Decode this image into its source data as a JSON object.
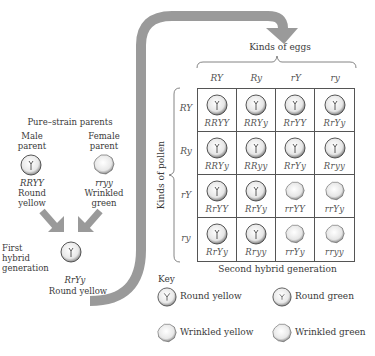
{
  "figure": {
    "parents_title": "Pure–strain parents",
    "male": {
      "label_line1": "Male",
      "label_line2": "parent",
      "genotype": "RRYY",
      "phenotype_line1": "Round",
      "phenotype_line2": "yellow",
      "pea": "round"
    },
    "female": {
      "label_line1": "Female",
      "label_line2": "parent",
      "genotype": "rryy",
      "phenotype_line1": "Wrinkled",
      "phenotype_line2": "green",
      "pea": "wrinkled"
    },
    "f1": {
      "label_line1": "First",
      "label_line2": "hybrid",
      "label_line3": "generation",
      "genotype": "RrYy",
      "phenotype": "Round yellow",
      "pea": "round"
    },
    "eggs_title": "Kinds of eggs",
    "pollen_title": "Kinds of pollen",
    "egg_types": [
      "RY",
      "Ry",
      "rY",
      "ry"
    ],
    "pollen_types": [
      "RY",
      "Ry",
      "rY",
      "ry"
    ],
    "punnett": [
      [
        {
          "g": "RRYY",
          "p": "round"
        },
        {
          "g": "RRYy",
          "p": "round"
        },
        {
          "g": "RrYY",
          "p": "round"
        },
        {
          "g": "RrYy",
          "p": "round"
        }
      ],
      [
        {
          "g": "RRYy",
          "p": "round"
        },
        {
          "g": "RRyy",
          "p": "round"
        },
        {
          "g": "RrYy",
          "p": "round"
        },
        {
          "g": "Rryy",
          "p": "round"
        }
      ],
      [
        {
          "g": "RrYY",
          "p": "round"
        },
        {
          "g": "RrYy",
          "p": "round"
        },
        {
          "g": "rrYY",
          "p": "wrinkled"
        },
        {
          "g": "rrYy",
          "p": "wrinkled"
        }
      ],
      [
        {
          "g": "RrYy",
          "p": "round"
        },
        {
          "g": "Rryy",
          "p": "round"
        },
        {
          "g": "rrYy",
          "p": "wrinkled"
        },
        {
          "g": "rryy",
          "p": "wrinkled"
        }
      ]
    ],
    "f2_caption": "Second hybrid generation",
    "key": {
      "title": "Key",
      "items": [
        {
          "label": "Round yellow",
          "pea": "round"
        },
        {
          "label": "Round green",
          "pea": "round"
        },
        {
          "label": "Wrinkled yellow",
          "pea": "wrinkled"
        },
        {
          "label": "Wrinkled green",
          "pea": "wrinkled"
        }
      ]
    },
    "colors": {
      "arrow": "#9a9a9a",
      "line": "#555555",
      "text": "#3a3a3a"
    }
  }
}
